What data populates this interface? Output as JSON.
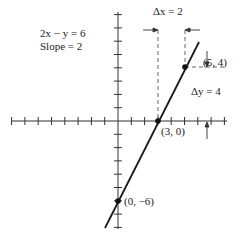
{
  "chart_data": {
    "type": "line",
    "title": "",
    "equation_label": "2x − y = 6",
    "slope_label": "Slope = 2",
    "xlabel": "",
    "ylabel": "",
    "xlim": [
      -8,
      8
    ],
    "ylim": [
      -8,
      8
    ],
    "grid": false,
    "tick_step": 1,
    "series": [
      {
        "name": "2x − y = 6",
        "x": [
          -0.5,
          5.5
        ],
        "y": [
          -7,
          5
        ]
      }
    ],
    "points": [
      {
        "label": "(5, 4)",
        "x": 5,
        "y": 4
      },
      {
        "label": "(3, 0)",
        "x": 3,
        "y": 0
      },
      {
        "label": "(0, −6)",
        "x": 0,
        "y": -6
      }
    ],
    "annotations": [
      {
        "text": "Δx = 2",
        "from_x": 3,
        "to_x": 5
      },
      {
        "text": "Δy = 4",
        "from_y": 0,
        "to_y": 4
      }
    ]
  },
  "labels": {
    "equation": "2x − y = 6",
    "slope": "Slope = 2",
    "delta_x": "Δx = 2",
    "delta_y": "Δy = 4",
    "point_5_4": "(5, 4)",
    "point_3_0": "(3, 0)",
    "point_0_neg6": "(0, −6)"
  },
  "colors": {
    "ink": "#222222",
    "dash": "#555555"
  }
}
